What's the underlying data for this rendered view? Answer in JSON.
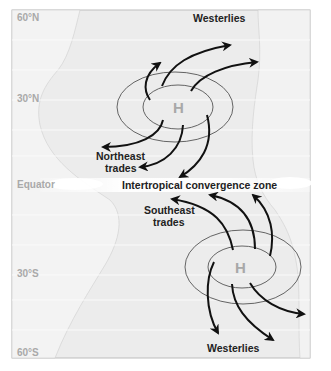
{
  "latitudes": {
    "n60": "60°N",
    "n30": "30°N",
    "equator": "Equator",
    "s30": "30°S",
    "s60": "60°S"
  },
  "labels": {
    "westerlies_north": "Westerlies",
    "northeast_trades_line1": "Northeast",
    "northeast_trades_line2": "trades",
    "itcz": "Intertropical convergence zone",
    "southeast_trades_line1": "Southeast",
    "southeast_trades_line2": "trades",
    "westerlies_south": "Westerlies"
  },
  "pressure_cells": {
    "north": "H",
    "south": "H"
  },
  "colors": {
    "ocean": "#ececec",
    "land": "#e3e3e3",
    "frame": "#bdbdbd",
    "arrow": "#111111",
    "isobar": "#555555",
    "lat_text": "#a9a9a9",
    "h_text": "#a8a8a8"
  }
}
